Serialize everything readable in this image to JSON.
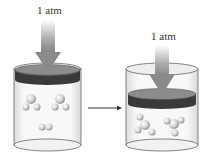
{
  "diagram": {
    "left_container": {
      "pressure_label": "1 atm",
      "state": "before reaction",
      "molecules": [
        "triatomic-molecule",
        "triatomic-molecule",
        "diatomic-molecule"
      ]
    },
    "right_container": {
      "pressure_label": "1 atm",
      "state": "after reaction",
      "molecules": [
        "tetratomic-molecule",
        "tetratomic-molecule"
      ]
    },
    "arrow": "reaction-arrow",
    "colors": {
      "arrow_fill": "#9a9a9a",
      "piston_top": "#8c8c8c",
      "piston_side": "#3a3a3a",
      "glass": "#e8e8e8",
      "molecule": "#d8d8d8"
    }
  }
}
